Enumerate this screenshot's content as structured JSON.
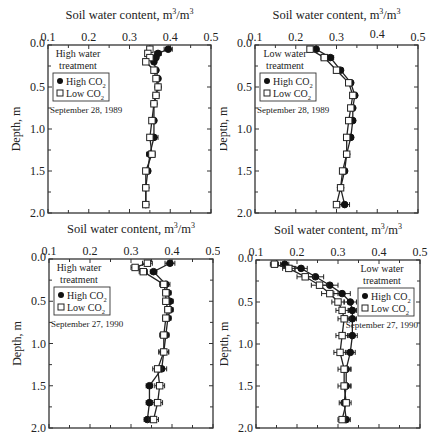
{
  "figure": {
    "xlabel": "Soil water content, m³/m³",
    "ylabel": "Depth, m",
    "x_ticks": [
      "0.1",
      "0.2",
      "0.3",
      "0.4",
      "0.5"
    ],
    "y_ticks": [
      "0.0",
      "0.5",
      "1.0",
      "1.5",
      "2.0"
    ]
  },
  "chart_data": [
    {
      "type": "line",
      "title": "High water treatment — September 28, 1989",
      "xlabel": "Soil water content, m³/m³",
      "ylabel": "Depth, m",
      "xlim": [
        0.1,
        0.5
      ],
      "ylim": [
        2.0,
        0.0
      ],
      "legend": {
        "title": "High water treatment",
        "date": "September 28, 1989",
        "position": "upper-left",
        "entries": [
          "High CO2",
          "Low CO2"
        ]
      },
      "series": [
        {
          "name": "High CO2",
          "marker": "filled-circle",
          "depth": [
            0.05,
            0.1,
            0.15,
            0.2,
            0.3,
            0.4,
            0.5,
            0.6,
            0.7,
            0.9,
            1.1,
            1.3,
            1.5,
            1.7,
            1.9
          ],
          "values": [
            0.395,
            0.37,
            0.365,
            0.36,
            0.365,
            0.37,
            0.37,
            0.365,
            0.36,
            0.36,
            0.36,
            0.35,
            0.345,
            0.34,
            0.34
          ],
          "error": [
            0.01,
            0.008,
            0.006,
            0.005,
            0.004,
            0.004,
            0.004,
            0.004,
            0.004,
            0.005,
            0.01,
            0.008,
            0.006,
            0.004,
            0.004
          ]
        },
        {
          "name": "Low CO2",
          "marker": "open-square",
          "depth": [
            0.05,
            0.1,
            0.15,
            0.2,
            0.3,
            0.4,
            0.5,
            0.6,
            0.7,
            0.9,
            1.1,
            1.3,
            1.5,
            1.7,
            1.9
          ],
          "values": [
            0.35,
            0.345,
            0.35,
            0.34,
            0.36,
            0.365,
            0.37,
            0.365,
            0.36,
            0.355,
            0.35,
            0.355,
            0.34,
            0.34,
            0.34
          ],
          "error": [
            0.006,
            0.006,
            0.006,
            0.005,
            0.004,
            0.004,
            0.004,
            0.004,
            0.004,
            0.005,
            0.006,
            0.008,
            0.006,
            0.004,
            0.004
          ]
        }
      ]
    },
    {
      "type": "line",
      "title": "Low water treatment — September 28, 1989",
      "xlabel": "Soil water content, m³/m³",
      "ylabel": "Depth, m",
      "xlim": [
        0.1,
        0.5
      ],
      "ylim": [
        2.0,
        0.0
      ],
      "legend": {
        "title": "Low water treatment",
        "date": "September 28, 1989",
        "position": "upper-left",
        "entries": [
          "High CO2",
          "Low CO2"
        ]
      },
      "series": [
        {
          "name": "High CO2",
          "marker": "filled-circle",
          "depth": [
            0.05,
            0.15,
            0.3,
            0.45,
            0.6,
            0.75,
            0.9,
            1.1,
            1.3,
            1.5,
            1.7,
            1.9
          ],
          "values": [
            0.25,
            0.285,
            0.31,
            0.335,
            0.345,
            0.34,
            0.34,
            0.335,
            0.325,
            0.32,
            0.31,
            0.32
          ],
          "error": [
            0.006,
            0.008,
            0.006,
            0.005,
            0.004,
            0.004,
            0.004,
            0.005,
            0.004,
            0.006,
            0.005,
            0.012
          ]
        },
        {
          "name": "Low CO2",
          "marker": "open-square",
          "depth": [
            0.05,
            0.15,
            0.3,
            0.45,
            0.6,
            0.75,
            0.9,
            1.1,
            1.3,
            1.5,
            1.7,
            1.9
          ],
          "values": [
            0.235,
            0.27,
            0.3,
            0.33,
            0.34,
            0.335,
            0.33,
            0.325,
            0.325,
            0.315,
            0.31,
            0.3
          ],
          "error": [
            0.006,
            0.008,
            0.006,
            0.005,
            0.004,
            0.004,
            0.004,
            0.005,
            0.004,
            0.006,
            0.005,
            0.006
          ]
        }
      ]
    },
    {
      "type": "line",
      "title": "High water treatment — September 27, 1990",
      "xlabel": "Soil water content, m³/m³",
      "ylabel": "Depth, m",
      "xlim": [
        0.1,
        0.5
      ],
      "ylim": [
        2.0,
        0.0
      ],
      "legend": {
        "title": "High water treatment",
        "date": "September 27, 1990",
        "position": "upper-left",
        "entries": [
          "High CO2",
          "Low CO2"
        ]
      },
      "series": [
        {
          "name": "High CO2",
          "marker": "filled-circle",
          "depth": [
            0.05,
            0.15,
            0.3,
            0.4,
            0.5,
            0.6,
            0.7,
            0.9,
            1.1,
            1.3,
            1.5,
            1.7,
            1.9
          ],
          "values": [
            0.395,
            0.355,
            0.385,
            0.39,
            0.395,
            0.395,
            0.39,
            0.385,
            0.38,
            0.375,
            0.345,
            0.345,
            0.34
          ],
          "error": [
            0.012,
            0.008,
            0.01,
            0.008,
            0.008,
            0.008,
            0.008,
            0.008,
            0.012,
            0.012,
            0.008,
            0.008,
            0.008
          ]
        },
        {
          "name": "Low CO2",
          "marker": "open-square",
          "depth": [
            0.05,
            0.1,
            0.15,
            0.3,
            0.4,
            0.5,
            0.6,
            0.7,
            0.9,
            1.1,
            1.3,
            1.5,
            1.7,
            1.9
          ],
          "values": [
            0.34,
            0.31,
            0.33,
            0.38,
            0.385,
            0.385,
            0.39,
            0.385,
            0.38,
            0.38,
            0.365,
            0.37,
            0.365,
            0.355
          ],
          "error": [
            0.012,
            0.01,
            0.01,
            0.01,
            0.008,
            0.008,
            0.008,
            0.008,
            0.01,
            0.012,
            0.012,
            0.012,
            0.012,
            0.012
          ]
        }
      ]
    },
    {
      "type": "line",
      "title": "Low water treatment — September 27, 1990",
      "xlabel": "Soil water content, m³/m³",
      "ylabel": "Depth, m",
      "xlim": [
        0.1,
        0.5
      ],
      "ylim": [
        2.0,
        0.0
      ],
      "legend": {
        "title": "Low water treatment",
        "date": "September 27, 1990",
        "position": "upper-right",
        "entries": [
          "High CO2",
          "Low CO2"
        ]
      },
      "series": [
        {
          "name": "High CO2",
          "marker": "filled-circle",
          "depth": [
            0.05,
            0.1,
            0.2,
            0.3,
            0.4,
            0.5,
            0.6,
            0.7,
            0.9,
            1.1,
            1.3,
            1.5,
            1.7,
            1.9
          ],
          "values": [
            0.17,
            0.21,
            0.245,
            0.28,
            0.31,
            0.33,
            0.335,
            0.335,
            0.335,
            0.33,
            0.32,
            0.32,
            0.315,
            0.32
          ],
          "error": [
            0.01,
            0.015,
            0.02,
            0.02,
            0.02,
            0.015,
            0.01,
            0.01,
            0.012,
            0.012,
            0.012,
            0.012,
            0.012,
            0.01
          ]
        },
        {
          "name": "Low CO2",
          "marker": "open-square",
          "depth": [
            0.05,
            0.1,
            0.2,
            0.3,
            0.4,
            0.5,
            0.6,
            0.7,
            0.9,
            1.1,
            1.3,
            1.5,
            1.7,
            1.9
          ],
          "values": [
            0.145,
            0.18,
            0.22,
            0.255,
            0.28,
            0.3,
            0.31,
            0.315,
            0.31,
            0.305,
            0.315,
            0.315,
            0.32,
            0.31
          ],
          "error": [
            0.01,
            0.015,
            0.02,
            0.02,
            0.02,
            0.015,
            0.015,
            0.015,
            0.015,
            0.015,
            0.015,
            0.015,
            0.012,
            0.01
          ]
        }
      ]
    }
  ],
  "panels": [
    {
      "legend_title_1": "High water",
      "legend_title_2": "treatment",
      "legend_high": "High CO",
      "legend_low": "Low CO",
      "sub": "2",
      "date": "September 28, 1989"
    },
    {
      "legend_title_1": "Low water",
      "legend_title_2": "treatment",
      "legend_high": "High CO",
      "legend_low": "Low CO",
      "sub": "2",
      "date": "September 28, 1989"
    },
    {
      "legend_title_1": "High water",
      "legend_title_2": "treatment",
      "legend_high": "High CO",
      "legend_low": "Low CO",
      "sub": "2",
      "date": "September 27, 1990"
    },
    {
      "legend_title_1": "Low water",
      "legend_title_2": "treatment",
      "legend_high": "High CO",
      "legend_low": "Low CO",
      "sub": "2",
      "date": "September 27, 1990"
    }
  ]
}
